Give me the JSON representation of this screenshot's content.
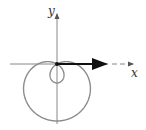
{
  "diagram": {
    "type": "polar-curve",
    "curve": "limacon-with-inner-loop",
    "equation_hint": "r = 1 - 2 sin(theta)",
    "axes": {
      "x_label": "x",
      "y_label": "y"
    },
    "colors": {
      "curve": "#8c8c8c",
      "axis": "#777777",
      "vector": "#111111"
    }
  }
}
